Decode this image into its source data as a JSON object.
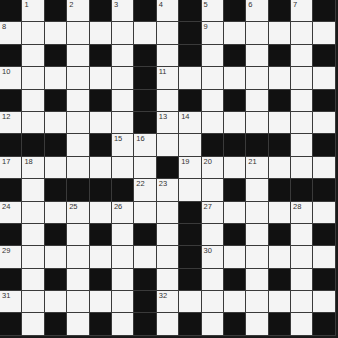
{
  "puzzle": {
    "rows": 15,
    "cols": 15,
    "colors": {
      "black": "#111111",
      "white": "#f4f4f4",
      "line": "#3a3a3a",
      "number": "#333333"
    },
    "layout": [
      "#.#.#.#.#.#.#.#",
      "........#......",
      "#.#.#.#.#.#.#.#",
      "......#........",
      "#.#.#.#.#.#.#.#",
      "......#........",
      "###.#....####.#",
      ".......#.......",
      "#.####....#.###",
      "........#......",
      "#.#.#.#.#.#.#.#",
      "........#......",
      "#.#.#.#.#.#.#.#",
      "......#........",
      "#.#.#.#.#.#.#.#"
    ],
    "numbers": [
      {
        "row": 0,
        "col": 1,
        "n": "1"
      },
      {
        "row": 0,
        "col": 3,
        "n": "2"
      },
      {
        "row": 0,
        "col": 5,
        "n": "3"
      },
      {
        "row": 0,
        "col": 7,
        "n": "4"
      },
      {
        "row": 0,
        "col": 9,
        "n": "5"
      },
      {
        "row": 0,
        "col": 11,
        "n": "6"
      },
      {
        "row": 0,
        "col": 13,
        "n": "7"
      },
      {
        "row": 1,
        "col": 0,
        "n": "8"
      },
      {
        "row": 1,
        "col": 9,
        "n": "9"
      },
      {
        "row": 3,
        "col": 0,
        "n": "10"
      },
      {
        "row": 3,
        "col": 7,
        "n": "11"
      },
      {
        "row": 5,
        "col": 0,
        "n": "12"
      },
      {
        "row": 5,
        "col": 7,
        "n": "13"
      },
      {
        "row": 5,
        "col": 8,
        "n": "14"
      },
      {
        "row": 6,
        "col": 5,
        "n": "15"
      },
      {
        "row": 6,
        "col": 6,
        "n": "16"
      },
      {
        "row": 7,
        "col": 0,
        "n": "17"
      },
      {
        "row": 7,
        "col": 1,
        "n": "18"
      },
      {
        "row": 7,
        "col": 8,
        "n": "19"
      },
      {
        "row": 7,
        "col": 9,
        "n": "20"
      },
      {
        "row": 7,
        "col": 11,
        "n": "21"
      },
      {
        "row": 8,
        "col": 6,
        "n": "22"
      },
      {
        "row": 8,
        "col": 7,
        "n": "23"
      },
      {
        "row": 9,
        "col": 0,
        "n": "24"
      },
      {
        "row": 9,
        "col": 3,
        "n": "25"
      },
      {
        "row": 9,
        "col": 5,
        "n": "26"
      },
      {
        "row": 9,
        "col": 9,
        "n": "27"
      },
      {
        "row": 9,
        "col": 13,
        "n": "28"
      },
      {
        "row": 11,
        "col": 0,
        "n": "29"
      },
      {
        "row": 11,
        "col": 9,
        "n": "30"
      },
      {
        "row": 13,
        "col": 0,
        "n": "31"
      },
      {
        "row": 13,
        "col": 7,
        "n": "32"
      }
    ]
  }
}
